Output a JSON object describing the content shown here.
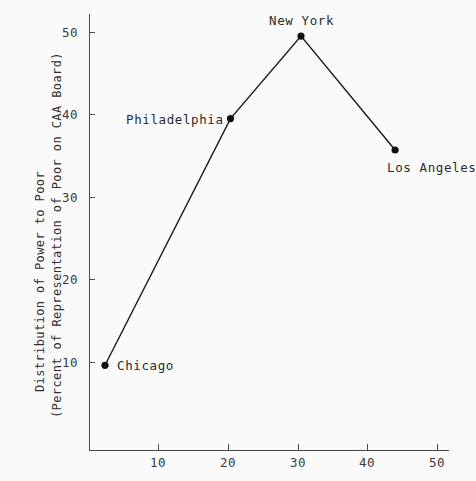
{
  "chart_data": {
    "type": "line",
    "title": "",
    "xlabel": "",
    "ylabel": "Distribution of Power to Poor (Percent of Representation of Poor on CAA Board)",
    "ylabel_line1": "Distribution of Power to Poor",
    "ylabel_line2": "(Percent of Representation of Poor on CAA Board)",
    "xlim": [
      0,
      52
    ],
    "ylim": [
      5,
      52
    ],
    "grid": false,
    "legend": "none",
    "xticks": [
      "10",
      "20",
      "30",
      "40",
      "50"
    ],
    "xtick_values": [
      10,
      20,
      30,
      40,
      50
    ],
    "yticks": [
      "10",
      "20",
      "30",
      "40",
      "50"
    ],
    "ytick_values": [
      10,
      20,
      30,
      40,
      50
    ],
    "points": [
      {
        "label": "Chicago",
        "x": 2.4,
        "y": 9.6,
        "label_pos": "right"
      },
      {
        "label": "Philadelphia",
        "x": 20.4,
        "y": 39.5,
        "label_pos": "left"
      },
      {
        "label": "New York",
        "x": 30.5,
        "y": 49.5,
        "label_pos": "above"
      },
      {
        "label": "Los Angeles",
        "x": 44.0,
        "y": 35.7,
        "label_pos": "below-right"
      }
    ],
    "series": [
      {
        "name": "Distribution of Power to Poor",
        "x": [
          2.4,
          20.4,
          30.5,
          44.0
        ],
        "values": [
          9.6,
          39.5,
          49.5,
          35.7
        ]
      }
    ],
    "colors": {
      "line": "#1a1a1a",
      "marker": "#111111",
      "axis": "#4a4a4a",
      "text": "#2b2b2b",
      "background": "#fafafa"
    }
  },
  "labels": {
    "chicago": "Chicago",
    "philadelphia": "Philadelphia",
    "new_york": "New York",
    "los_angeles": "Los Angeles"
  },
  "xticks": {
    "t0": "10",
    "t1": "20",
    "t2": "30",
    "t3": "40",
    "t4": "50"
  },
  "yticks": {
    "t0": "10",
    "t1": "20",
    "t2": "30",
    "t3": "40",
    "t4": "50"
  }
}
